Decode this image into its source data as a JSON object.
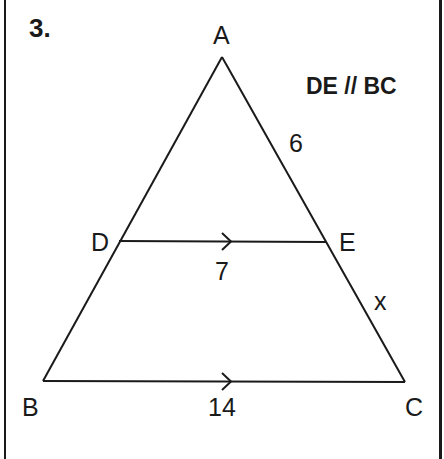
{
  "problem": {
    "number": "3.",
    "condition": "DE // BC"
  },
  "vertices": {
    "A": "A",
    "B": "B",
    "C": "C",
    "D": "D",
    "E": "E"
  },
  "lengths": {
    "AE": "6",
    "EC": "x",
    "DE": "7",
    "BC": "14"
  },
  "colors": {
    "ink": "#1a1a1a",
    "background": "#ffffff"
  }
}
